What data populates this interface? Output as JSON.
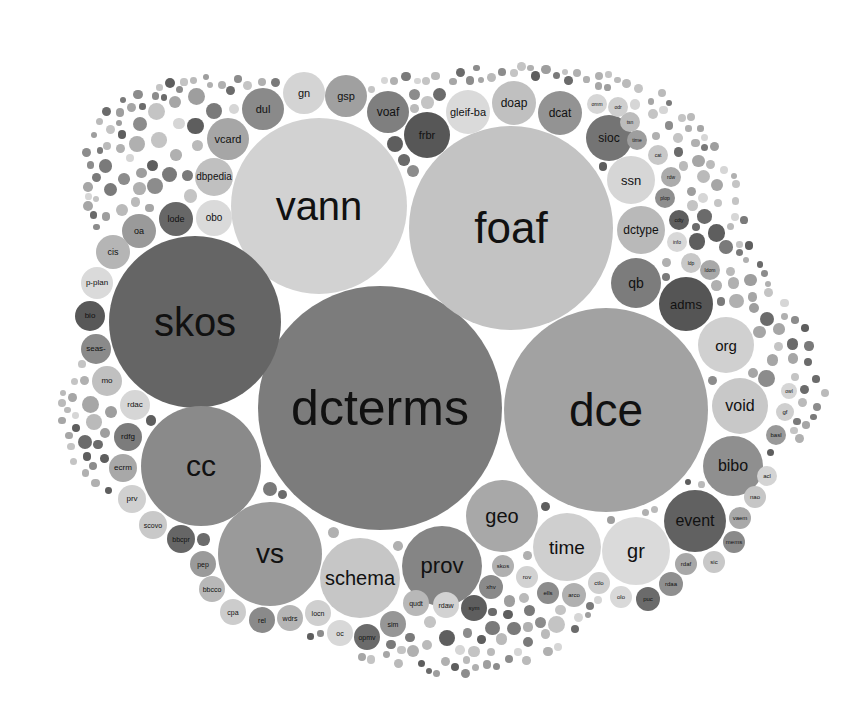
{
  "chart_data": {
    "type": "bubble-pack",
    "title": "",
    "palette": [
      "#7a7a7a",
      "#8c8c8c",
      "#9e9e9e",
      "#b0b0b0",
      "#c4c4c4",
      "#d6d6d6",
      "#5e5e5e",
      "#6b6b6b"
    ],
    "bubbles": [
      {
        "label": "dcterms",
        "cx": 380,
        "cy": 408,
        "r": 122,
        "fill": "#7c7c7c",
        "fs": 50
      },
      {
        "label": "dce",
        "cx": 606,
        "cy": 410,
        "r": 102,
        "fill": "#a2a2a2",
        "fs": 46
      },
      {
        "label": "foaf",
        "cx": 511,
        "cy": 228,
        "r": 102,
        "fill": "#c3c3c3",
        "fs": 44
      },
      {
        "label": "vann",
        "cx": 319,
        "cy": 206,
        "r": 88,
        "fill": "#d2d2d2",
        "fs": 40
      },
      {
        "label": "skos",
        "cx": 195,
        "cy": 322,
        "r": 86,
        "fill": "#656565",
        "fs": 40
      },
      {
        "label": "cc",
        "cx": 201,
        "cy": 466,
        "r": 60,
        "fill": "#8a8a8a",
        "fs": 30
      },
      {
        "label": "vs",
        "cx": 270,
        "cy": 554,
        "r": 52,
        "fill": "#9a9a9a",
        "fs": 28
      },
      {
        "label": "schema",
        "cx": 360,
        "cy": 578,
        "r": 40,
        "fill": "#c6c6c6",
        "fs": 20
      },
      {
        "label": "prov",
        "cx": 442,
        "cy": 566,
        "r": 40,
        "fill": "#858585",
        "fs": 22
      },
      {
        "label": "geo",
        "cx": 502,
        "cy": 516,
        "r": 36,
        "fill": "#a8a8a8",
        "fs": 20
      },
      {
        "label": "time",
        "cx": 567,
        "cy": 547,
        "r": 34,
        "fill": "#cfcfcf",
        "fs": 19
      },
      {
        "label": "gr",
        "cx": 636,
        "cy": 551,
        "r": 34,
        "fill": "#dadada",
        "fs": 20
      },
      {
        "label": "event",
        "cx": 695,
        "cy": 521,
        "r": 31,
        "fill": "#616161",
        "fs": 16
      },
      {
        "label": "bibo",
        "cx": 733,
        "cy": 466,
        "r": 30,
        "fill": "#8f8f8f",
        "fs": 16
      },
      {
        "label": "void",
        "cx": 740,
        "cy": 406,
        "r": 28,
        "fill": "#c8c8c8",
        "fs": 16
      },
      {
        "label": "org",
        "cx": 726,
        "cy": 345,
        "r": 28,
        "fill": "#d0d0d0",
        "fs": 15
      },
      {
        "label": "adms",
        "cx": 686,
        "cy": 304,
        "r": 27,
        "fill": "#555555",
        "fs": 13
      },
      {
        "label": "qb",
        "cx": 636,
        "cy": 283,
        "r": 25,
        "fill": "#7c7c7c",
        "fs": 14
      },
      {
        "label": "dctype",
        "cx": 641,
        "cy": 230,
        "r": 24,
        "fill": "#b9b9b9",
        "fs": 12
      },
      {
        "label": "ssn",
        "cx": 631,
        "cy": 180,
        "r": 24,
        "fill": "#d6d6d6",
        "fs": 13
      },
      {
        "label": "sioc",
        "cx": 609,
        "cy": 138,
        "r": 23,
        "fill": "#747474",
        "fs": 12
      },
      {
        "label": "dcat",
        "cx": 560,
        "cy": 113,
        "r": 22,
        "fill": "#939393",
        "fs": 12
      },
      {
        "label": "doap",
        "cx": 514,
        "cy": 103,
        "r": 22,
        "fill": "#c0c0c0",
        "fs": 12
      },
      {
        "label": "gleif-ba",
        "cx": 468,
        "cy": 112,
        "r": 22,
        "fill": "#dadada",
        "fs": 11
      },
      {
        "label": "frbr",
        "cx": 427,
        "cy": 135,
        "r": 23,
        "fill": "#575757",
        "fs": 11
      },
      {
        "label": "voaf",
        "cx": 388,
        "cy": 112,
        "r": 21,
        "fill": "#7f7f7f",
        "fs": 12
      },
      {
        "label": "gsp",
        "cx": 346,
        "cy": 96,
        "r": 21,
        "fill": "#a0a0a0",
        "fs": 11
      },
      {
        "label": "gn",
        "cx": 304,
        "cy": 93,
        "r": 21,
        "fill": "#d4d4d4",
        "fs": 11
      },
      {
        "label": "dul",
        "cx": 263,
        "cy": 109,
        "r": 21,
        "fill": "#8a8a8a",
        "fs": 11
      },
      {
        "label": "vcard",
        "cx": 228,
        "cy": 139,
        "r": 21,
        "fill": "#a6a6a6",
        "fs": 11
      },
      {
        "label": "dbpedia",
        "cx": 214,
        "cy": 177,
        "r": 19,
        "fill": "#c0c0c0",
        "fs": 10
      },
      {
        "label": "obo",
        "cx": 214,
        "cy": 218,
        "r": 18,
        "fill": "#dadada",
        "fs": 10
      },
      {
        "label": "lode",
        "cx": 176,
        "cy": 219,
        "r": 17,
        "fill": "#676767",
        "fs": 9
      },
      {
        "label": "oa",
        "cx": 139,
        "cy": 231,
        "r": 17,
        "fill": "#9a9a9a",
        "fs": 9
      },
      {
        "label": "cis",
        "cx": 113,
        "cy": 252,
        "r": 17,
        "fill": "#b5b5b5",
        "fs": 9
      },
      {
        "label": "p-plan",
        "cx": 97,
        "cy": 283,
        "r": 16,
        "fill": "#dadada",
        "fs": 8
      },
      {
        "label": "bio",
        "cx": 90,
        "cy": 316,
        "r": 15,
        "fill": "#585858",
        "fs": 8
      },
      {
        "label": "seas-",
        "cx": 96,
        "cy": 349,
        "r": 15,
        "fill": "#8a8a8a",
        "fs": 8
      },
      {
        "label": "mo",
        "cx": 107,
        "cy": 381,
        "r": 15,
        "fill": "#c0c0c0",
        "fs": 8
      },
      {
        "label": "rdac",
        "cx": 135,
        "cy": 405,
        "r": 15,
        "fill": "#d6d6d6",
        "fs": 8
      },
      {
        "label": "rdfg",
        "cx": 128,
        "cy": 437,
        "r": 14,
        "fill": "#7c7c7c",
        "fs": 8
      },
      {
        "label": "ecrm",
        "cx": 123,
        "cy": 468,
        "r": 14,
        "fill": "#a8a8a8",
        "fs": 8
      },
      {
        "label": "prv",
        "cx": 132,
        "cy": 499,
        "r": 14,
        "fill": "#d0d0d0",
        "fs": 8
      },
      {
        "label": "scovo",
        "cx": 153,
        "cy": 525,
        "r": 14,
        "fill": "#c9c9c9",
        "fs": 7
      },
      {
        "label": "bbcpr",
        "cx": 181,
        "cy": 539,
        "r": 14,
        "fill": "#666666",
        "fs": 7
      },
      {
        "label": "pep",
        "cx": 203,
        "cy": 564,
        "r": 13,
        "fill": "#9a9a9a",
        "fs": 7
      },
      {
        "label": "bbcco",
        "cx": 212,
        "cy": 589,
        "r": 13,
        "fill": "#b8b8b8",
        "fs": 7
      },
      {
        "label": "cpa",
        "cx": 233,
        "cy": 612,
        "r": 13,
        "fill": "#cccccc",
        "fs": 7
      },
      {
        "label": "rel",
        "cx": 262,
        "cy": 620,
        "r": 13,
        "fill": "#8a8a8a",
        "fs": 7
      },
      {
        "label": "wdrs",
        "cx": 290,
        "cy": 618,
        "r": 13,
        "fill": "#b5b5b5",
        "fs": 7
      },
      {
        "label": "locn",
        "cx": 318,
        "cy": 613,
        "r": 13,
        "fill": "#cfcfcf",
        "fs": 7
      },
      {
        "label": "oc",
        "cx": 340,
        "cy": 633,
        "r": 13,
        "fill": "#d8d8d8",
        "fs": 7
      },
      {
        "label": "opmv",
        "cx": 367,
        "cy": 637,
        "r": 13,
        "fill": "#6b6b6b",
        "fs": 7
      },
      {
        "label": "sim",
        "cx": 393,
        "cy": 624,
        "r": 13,
        "fill": "#969696",
        "fs": 7
      },
      {
        "label": "qudt",
        "cx": 416,
        "cy": 603,
        "r": 13,
        "fill": "#b8b8b8",
        "fs": 7
      },
      {
        "label": "rdaw",
        "cx": 446,
        "cy": 605,
        "r": 13,
        "fill": "#d2d2d2",
        "fs": 7
      },
      {
        "label": "sym",
        "cx": 474,
        "cy": 608,
        "r": 13,
        "fill": "#5e5e5e",
        "fs": 6
      },
      {
        "label": "xhv",
        "cx": 491,
        "cy": 587,
        "r": 12,
        "fill": "#8a8a8a",
        "fs": 6
      },
      {
        "label": "skos",
        "cx": 503,
        "cy": 566,
        "r": 11,
        "fill": "#b0b0b0",
        "fs": 6
      },
      {
        "label": "rov",
        "cx": 527,
        "cy": 577,
        "r": 11,
        "fill": "#d2d2d2",
        "fs": 6
      },
      {
        "label": "ells",
        "cx": 548,
        "cy": 593,
        "r": 11,
        "fill": "#8c8c8c",
        "fs": 6
      },
      {
        "label": "arco",
        "cx": 574,
        "cy": 595,
        "r": 12,
        "fill": "#b0b0b0",
        "fs": 6
      },
      {
        "label": "ctlo",
        "cx": 599,
        "cy": 583,
        "r": 11,
        "fill": "#cfcfcf",
        "fs": 6
      },
      {
        "label": "olo",
        "cx": 621,
        "cy": 597,
        "r": 11,
        "fill": "#d9d9d9",
        "fs": 6
      },
      {
        "label": "puc",
        "cx": 648,
        "cy": 599,
        "r": 12,
        "fill": "#6b6b6b",
        "fs": 6
      },
      {
        "label": "rdaa",
        "cx": 671,
        "cy": 584,
        "r": 12,
        "fill": "#8f8f8f",
        "fs": 6
      },
      {
        "label": "rdaf",
        "cx": 686,
        "cy": 564,
        "r": 11,
        "fill": "#a8a8a8",
        "fs": 6
      },
      {
        "label": "sic",
        "cx": 714,
        "cy": 562,
        "r": 11,
        "fill": "#c8c8c8",
        "fs": 6
      },
      {
        "label": "mems",
        "cx": 734,
        "cy": 542,
        "r": 11,
        "fill": "#8a8a8a",
        "fs": 6
      },
      {
        "label": "vaem",
        "cx": 740,
        "cy": 518,
        "r": 11,
        "fill": "#a8a8a8",
        "fs": 6
      },
      {
        "label": "nao",
        "cx": 755,
        "cy": 497,
        "r": 11,
        "fill": "#c6c6c6",
        "fs": 6
      },
      {
        "label": "acl",
        "cx": 767,
        "cy": 476,
        "r": 10,
        "fill": "#d4d4d4",
        "fs": 6
      },
      {
        "label": "basl",
        "cx": 776,
        "cy": 435,
        "r": 10,
        "fill": "#999999",
        "fs": 6
      },
      {
        "label": "gf",
        "cx": 785,
        "cy": 412,
        "r": 9,
        "fill": "#cfcfcf",
        "fs": 6
      },
      {
        "label": "owl",
        "cx": 789,
        "cy": 391,
        "r": 8,
        "fill": "#d6d6d6",
        "fs": 5
      },
      {
        "label": "ldp",
        "cx": 691,
        "cy": 263,
        "r": 10,
        "fill": "#c8c8c8",
        "fs": 5
      },
      {
        "label": "ldom",
        "cx": 710,
        "cy": 270,
        "r": 10,
        "fill": "#a8a8a8",
        "fs": 5
      },
      {
        "label": "info",
        "cx": 677,
        "cy": 242,
        "r": 10,
        "fill": "#d8d8d8",
        "fs": 5
      },
      {
        "label": "cdty",
        "cx": 679,
        "cy": 220,
        "r": 10,
        "fill": "#5e5e5e",
        "fs": 5
      },
      {
        "label": "plop",
        "cx": 665,
        "cy": 198,
        "r": 10,
        "fill": "#8f8f8f",
        "fs": 5
      },
      {
        "label": "rdw",
        "cx": 671,
        "cy": 177,
        "r": 10,
        "fill": "#ababab",
        "fs": 5
      },
      {
        "label": "cat",
        "cx": 658,
        "cy": 155,
        "r": 10,
        "fill": "#c8c8c8",
        "fs": 5
      },
      {
        "label": "time",
        "cx": 637,
        "cy": 140,
        "r": 10,
        "fill": "#9e9e9e",
        "fs": 5
      },
      {
        "label": "tsn",
        "cx": 630,
        "cy": 122,
        "r": 10,
        "fill": "#bcbcbc",
        "fs": 5
      },
      {
        "label": "odr",
        "cx": 618,
        "cy": 107,
        "r": 10,
        "fill": "#cfcfcf",
        "fs": 5
      },
      {
        "label": "omm",
        "cx": 597,
        "cy": 104,
        "r": 10,
        "fill": "#d6d6d6",
        "fs": 5
      }
    ]
  },
  "chart": {
    "filler_ring": {
      "cx": 420,
      "cy": 360,
      "shape_radii_x": [
        345,
        360,
        380,
        355,
        330,
        300,
        290,
        300,
        340,
        380,
        400,
        390
      ],
      "colors": [
        "#7a7a7a",
        "#8c8c8c",
        "#9e9e9e",
        "#b0b0b0",
        "#c4c4c4",
        "#d6d6d6",
        "#5e5e5e",
        "#6b6b6b",
        "#a6a6a6",
        "#bababa"
      ]
    }
  }
}
